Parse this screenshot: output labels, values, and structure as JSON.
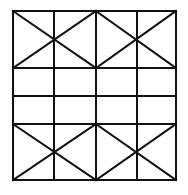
{
  "diagram": {
    "stroke_color": "#111111",
    "background_color": "#ffffff",
    "stroke_width": 2,
    "grid": {
      "x": [
        13,
        54,
        96,
        137,
        176
      ],
      "y": [
        11,
        68,
        96,
        124,
        180
      ]
    },
    "diagonals": [
      {
        "x1": 13,
        "y1": 11,
        "x2": 96,
        "y2": 68
      },
      {
        "x1": 13,
        "y1": 68,
        "x2": 96,
        "y2": 11
      },
      {
        "x1": 96,
        "y1": 11,
        "x2": 176,
        "y2": 68
      },
      {
        "x1": 96,
        "y1": 68,
        "x2": 176,
        "y2": 11
      },
      {
        "x1": 13,
        "y1": 124,
        "x2": 96,
        "y2": 180
      },
      {
        "x1": 13,
        "y1": 180,
        "x2": 96,
        "y2": 124
      },
      {
        "x1": 96,
        "y1": 124,
        "x2": 176,
        "y2": 180
      },
      {
        "x1": 96,
        "y1": 180,
        "x2": 176,
        "y2": 124
      }
    ]
  }
}
